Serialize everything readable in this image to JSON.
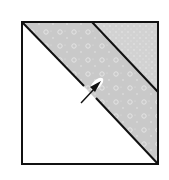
{
  "diagram": {
    "type": "quilt-block",
    "colors": {
      "background": "#ffffff",
      "outline": "#111111",
      "strip_fabric": "#c8c8c8",
      "corner_fabric": "#d4d4d4",
      "dots": "#e6e6e6",
      "arrow": "#111111"
    },
    "square": {
      "x": 22,
      "y": 22,
      "w": 136,
      "h": 142
    },
    "strip_line_top_x": 92,
    "strip_line_right_y": 92,
    "arrow": {
      "from": [
        81,
        103
      ],
      "to": [
        101,
        82
      ],
      "direction": "up-right"
    }
  }
}
